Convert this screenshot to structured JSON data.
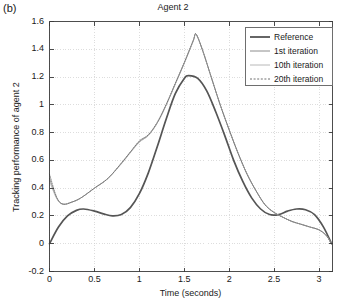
{
  "panel": {
    "label": "(b)"
  },
  "chart_data": {
    "type": "line",
    "title": "Agent 2",
    "xlabel": "Time (seconds)",
    "ylabel": "Tracking performance of agent 2",
    "xlim": [
      0,
      3.15
    ],
    "ylim": [
      -0.2,
      1.6
    ],
    "xticks": [
      "0",
      "0.5",
      "1",
      "1.5",
      "2",
      "2.5",
      "3"
    ],
    "xtick_values": [
      0,
      0.5,
      1,
      1.5,
      2,
      2.5,
      3
    ],
    "yticks": [
      "1.6",
      "1.4",
      "1.2",
      "1",
      "0.8",
      "0.6",
      "0.4",
      "0.2",
      "0",
      "-0.2"
    ],
    "ytick_values": [
      1.6,
      1.4,
      1.2,
      1.0,
      0.8,
      0.6,
      0.4,
      0.2,
      0.0,
      -0.2
    ],
    "grid": true,
    "grid_color": "#cfcfcf",
    "legend_position": "top-right",
    "series": [
      {
        "name": "Reference",
        "style": "solid",
        "width": 1.7,
        "color": "#555555",
        "x": [
          0,
          0.1,
          0.2,
          0.3,
          0.38,
          0.5,
          0.6,
          0.7,
          0.8,
          0.9,
          1.0,
          1.1,
          1.2,
          1.3,
          1.4,
          1.5,
          1.55,
          1.65,
          1.75,
          1.85,
          1.95,
          2.05,
          2.15,
          2.25,
          2.35,
          2.45,
          2.55,
          2.65,
          2.75,
          2.85,
          2.95,
          3.05,
          3.14
        ],
        "y": [
          0.0,
          0.12,
          0.2,
          0.24,
          0.25,
          0.235,
          0.215,
          0.2,
          0.21,
          0.26,
          0.36,
          0.51,
          0.7,
          0.9,
          1.08,
          1.19,
          1.21,
          1.19,
          1.1,
          0.95,
          0.78,
          0.6,
          0.45,
          0.33,
          0.25,
          0.21,
          0.21,
          0.235,
          0.25,
          0.245,
          0.21,
          0.12,
          0.0
        ]
      },
      {
        "name": "1st iteration",
        "style": "solid",
        "width": 0.9,
        "color": "#8c8c8c",
        "x": [
          0,
          0.08,
          0.15,
          0.25,
          0.35,
          0.5,
          0.65,
          0.8,
          0.9,
          1.0,
          1.1,
          1.2,
          1.3,
          1.4,
          1.5,
          1.6,
          1.63,
          1.7,
          1.8,
          1.9,
          2.0,
          2.1,
          2.2,
          2.3,
          2.4,
          2.5,
          2.6,
          2.7,
          2.8,
          2.9,
          3.0,
          3.08,
          3.14
        ],
        "y": [
          0.47,
          0.33,
          0.285,
          0.3,
          0.33,
          0.4,
          0.47,
          0.58,
          0.66,
          0.735,
          0.78,
          0.87,
          1.0,
          1.15,
          1.3,
          1.46,
          1.51,
          1.4,
          1.2,
          1.0,
          0.82,
          0.65,
          0.5,
          0.38,
          0.28,
          0.225,
          0.19,
          0.16,
          0.14,
          0.12,
          0.1,
          0.06,
          0.0
        ]
      },
      {
        "name": "10th iteration",
        "style": "solid",
        "width": 0.8,
        "color": "#b0b0b0",
        "x": [
          0,
          0.08,
          0.15,
          0.25,
          0.35,
          0.5,
          0.65,
          0.8,
          0.9,
          1.0,
          1.1,
          1.2,
          1.3,
          1.4,
          1.5,
          1.6,
          1.63,
          1.7,
          1.8,
          1.9,
          2.0,
          2.1,
          2.2,
          2.3,
          2.4,
          2.5,
          2.6,
          2.7,
          2.8,
          2.9,
          3.0,
          3.08,
          3.14
        ],
        "y": [
          0.45,
          0.325,
          0.285,
          0.3,
          0.33,
          0.4,
          0.47,
          0.575,
          0.655,
          0.73,
          0.78,
          0.87,
          1.0,
          1.15,
          1.3,
          1.46,
          1.505,
          1.4,
          1.2,
          1.0,
          0.82,
          0.65,
          0.5,
          0.38,
          0.28,
          0.225,
          0.19,
          0.16,
          0.14,
          0.12,
          0.1,
          0.06,
          0.0
        ]
      },
      {
        "name": "20th iteration",
        "style": "dotted",
        "width": 0.9,
        "color": "#707070",
        "x": [
          0,
          0.08,
          0.15,
          0.25,
          0.35,
          0.5,
          0.65,
          0.8,
          0.9,
          1.0,
          1.1,
          1.2,
          1.3,
          1.4,
          1.5,
          1.6,
          1.63,
          1.7,
          1.8,
          1.9,
          2.0,
          2.1,
          2.2,
          2.3,
          2.4,
          2.5,
          2.6,
          2.7,
          2.8,
          2.9,
          3.0,
          3.08,
          3.14
        ],
        "y": [
          0.5,
          0.335,
          0.285,
          0.3,
          0.33,
          0.4,
          0.47,
          0.58,
          0.66,
          0.74,
          0.785,
          0.875,
          1.005,
          1.155,
          1.305,
          1.465,
          1.51,
          1.4,
          1.2,
          1.0,
          0.82,
          0.65,
          0.5,
          0.38,
          0.28,
          0.225,
          0.19,
          0.16,
          0.14,
          0.12,
          0.1,
          0.06,
          0.0
        ]
      }
    ],
    "legend": [
      {
        "label": "Reference",
        "style": "solid",
        "color": "#555555",
        "width": 1.8
      },
      {
        "label": "1st iteration",
        "style": "solid",
        "color": "#8c8c8c",
        "width": 1
      },
      {
        "label": "10th iteration",
        "style": "solid",
        "color": "#b8b8b8",
        "width": 1
      },
      {
        "label": "20th iteration",
        "style": "dotted",
        "color": "#707070",
        "width": 1
      }
    ]
  }
}
